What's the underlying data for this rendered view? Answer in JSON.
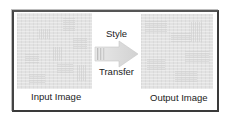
{
  "diagram": {
    "type": "process-flow",
    "nodes": [
      {
        "id": "input",
        "label": "Input Image",
        "kind": "texture-image"
      },
      {
        "id": "output",
        "label": "Output Image",
        "kind": "texture-image"
      }
    ],
    "edges": [
      {
        "from": "input",
        "to": "output",
        "label_top": "Style",
        "label_bottom": "Transfer",
        "kind": "block-arrow"
      }
    ]
  },
  "labels": {
    "input_image": "Input Image",
    "output_image": "Output Image",
    "arrow_top": "Style",
    "arrow_bottom": "Transfer"
  },
  "colors": {
    "frame_border": "#3a3a3a",
    "image_fill": "#e2e2e2",
    "arrow_fill_start": "#e8e8e8",
    "arrow_fill_end": "#d0d0d0",
    "text": "#222222"
  }
}
